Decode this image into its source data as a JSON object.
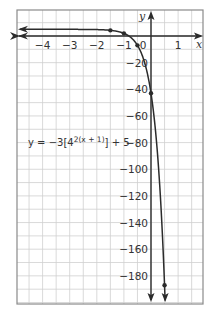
{
  "chart_data": {
    "type": "line",
    "title": "",
    "xlabel": "x",
    "ylabel": "y",
    "xlim": [
      -4.9,
      1.9
    ],
    "ylim": [
      -198,
      20
    ],
    "grid": true,
    "x_ticks": [
      -4,
      -3,
      -2,
      -1,
      0,
      1
    ],
    "x_tick_labels": [
      "−4",
      "−3",
      "−2",
      "−1",
      "0",
      "1"
    ],
    "y_ticks": [
      -20,
      -40,
      -60,
      -80,
      -100,
      -120,
      -140,
      -160,
      -180
    ],
    "y_tick_labels": [
      "−20",
      "−40",
      "−60",
      "−80",
      "−100",
      "−120",
      "−140",
      "−160",
      "−180"
    ],
    "annotation": {
      "prefix": "y = −3[4",
      "exponent": "2(x + 1)",
      "suffix": "] + 5"
    },
    "series": [
      {
        "name": "y = -3[4^(2(x+1))] + 5",
        "function": "-3*4^(2*(x+1))+5",
        "marked_points": [
          {
            "x": -1.5,
            "y": 4.25
          },
          {
            "x": -1,
            "y": 2
          },
          {
            "x": -0.5,
            "y": -7
          },
          {
            "x": 0,
            "y": -43
          },
          {
            "x": 0.5,
            "y": -187
          }
        ],
        "asymptote": {
          "y": 5
        },
        "arrows": [
          "left",
          "down"
        ]
      }
    ],
    "colors": {
      "curve": "#2b2b2b",
      "axes": "#2b2b2b",
      "grid": "#cfcfcf",
      "frame": "#8a8a8a"
    }
  }
}
